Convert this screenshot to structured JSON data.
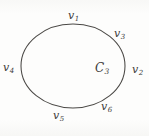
{
  "figure": {
    "kind": "graph-cycle-diagram",
    "shape": "ellipse",
    "center_label": "C",
    "center_subscript": "3",
    "stroke_color": "#4a4845",
    "background_color": "#fdfdfc",
    "text_color": "#3c3a38",
    "vertices": [
      {
        "id": "v1",
        "symbol": "v",
        "subscript": "1",
        "position": "top"
      },
      {
        "id": "v2",
        "symbol": "v",
        "subscript": "2",
        "position": "right"
      },
      {
        "id": "v3",
        "symbol": "v",
        "subscript": "3",
        "position": "upper-right"
      },
      {
        "id": "v4",
        "symbol": "v",
        "subscript": "4",
        "position": "left"
      },
      {
        "id": "v5",
        "symbol": "v",
        "subscript": "5",
        "position": "bottom-left"
      },
      {
        "id": "v6",
        "symbol": "v",
        "subscript": "6",
        "position": "bottom-right"
      }
    ]
  }
}
